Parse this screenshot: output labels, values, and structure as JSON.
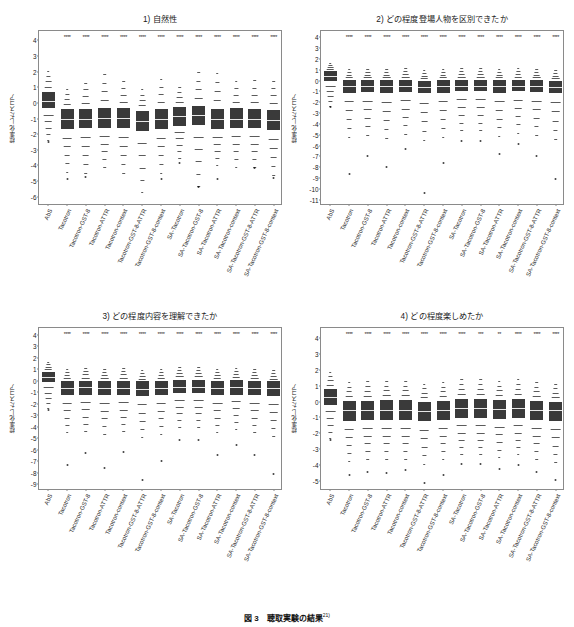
{
  "figure": {
    "caption_number": "図 3",
    "caption_text": "聴取実験の結果",
    "caption_superscript": "21)"
  },
  "axis": {
    "ylabel": "標準化したスコア"
  },
  "categories": [
    "AbS",
    "Tacotron",
    "Tacotron-GST-8",
    "Tacotron-ATTR",
    "Tacotron-context",
    "Tacotron-GST-8-ATTR",
    "Tacotron-GST-8-context",
    "SA-Tacotron",
    "SA-Tacotron-GST-8",
    "SA-Tacotron-ATTR",
    "SA-Tacotron-context",
    "SA-Tacotron-GST-8-ATTR",
    "SA-Tacotron-GST-8-context"
  ],
  "chart_data": [
    {
      "type": "box",
      "panel_id": 1,
      "title": "1) 自然性",
      "xlabel": "",
      "ylabel": "標準化したスコア",
      "ylim": [
        -6.6,
        4.6
      ],
      "yticks": [
        4,
        3,
        2,
        1,
        0,
        -1,
        -2,
        -3,
        -4,
        -5,
        -6
      ],
      "grid": false,
      "categories": [
        "AbS",
        "Tacotron",
        "Tacotron-GST-8",
        "Tacotron-ATTR",
        "Tacotron-context",
        "Tacotron-GST-8-ATTR",
        "Tacotron-GST-8-context",
        "SA-Tacotron",
        "SA-Tacotron-GST-8",
        "SA-Tacotron-ATTR",
        "SA-Tacotron-context",
        "SA-Tacotron-GST-8-ATTR",
        "SA-Tacotron-GST-8-context"
      ],
      "median": [
        0.15,
        -1.05,
        -1.0,
        -0.95,
        -0.95,
        -1.15,
        -1.0,
        -0.85,
        -0.8,
        -1.05,
        -1.0,
        -1.0,
        -1.1
      ],
      "q1": [
        -0.35,
        -1.7,
        -1.6,
        -1.6,
        -1.6,
        -1.8,
        -1.65,
        -1.45,
        -1.4,
        -1.7,
        -1.6,
        -1.6,
        -1.75
      ],
      "q3": [
        0.7,
        -0.4,
        -0.4,
        -0.35,
        -0.35,
        -0.5,
        -0.4,
        -0.25,
        -0.2,
        -0.4,
        -0.35,
        -0.4,
        -0.45
      ],
      "whisker_low": [
        -2.4,
        -4.4,
        -4.5,
        -4.1,
        -4.5,
        -5.7,
        -4.5,
        -3.5,
        -5.3,
        -4.0,
        -4.1,
        -4.1,
        -4.6
      ],
      "whisker_high": [
        2.4,
        1.2,
        1.7,
        2.4,
        1.8,
        1.2,
        2.0,
        1.3,
        2.5,
        2.5,
        1.8,
        1.9,
        1.9
      ],
      "outliers_low": [
        -2.5,
        -4.85,
        -4.75,
        -4.1,
        -4.5,
        -5.7,
        -4.85,
        -3.85,
        -5.4,
        -4.85,
        -4.1,
        -4.15,
        -4.8
      ],
      "significance": [
        "",
        "****",
        "****",
        "****",
        "****",
        "****",
        "****",
        "****",
        "****",
        "****",
        "****",
        "****",
        "****"
      ]
    },
    {
      "type": "box",
      "panel_id": 2,
      "title": "2) どの程度登場人物を区別できたか",
      "xlabel": "",
      "ylabel": "標準化したスコア",
      "ylim": [
        -11.6,
        4.6
      ],
      "yticks": [
        4,
        3,
        2,
        1,
        0,
        -1,
        -2,
        -3,
        -4,
        -5,
        -6,
        -7,
        -8,
        -9,
        -10,
        -11
      ],
      "grid": false,
      "categories": [
        "AbS",
        "Tacotron",
        "Tacotron-GST-8",
        "Tacotron-ATTR",
        "Tacotron-context",
        "Tacotron-GST-8-ATTR",
        "Tacotron-GST-8-context",
        "SA-Tacotron",
        "SA-Tacotron-GST-8",
        "SA-Tacotron-ATTR",
        "SA-Tacotron-context",
        "SA-Tacotron-GST-8-ATTR",
        "SA-Tacotron-GST-8-context"
      ],
      "median": [
        0.45,
        -0.5,
        -0.5,
        -0.5,
        -0.5,
        -0.55,
        -0.5,
        -0.45,
        -0.45,
        -0.5,
        -0.45,
        -0.5,
        -0.55
      ],
      "q1": [
        0.0,
        -1.1,
        -1.05,
        -1.1,
        -1.05,
        -1.15,
        -1.1,
        -1.0,
        -1.0,
        -1.1,
        -1.0,
        -1.05,
        -1.15
      ],
      "q3": [
        0.9,
        0.05,
        0.05,
        0.05,
        0.1,
        0.0,
        0.05,
        0.1,
        0.1,
        0.05,
        0.1,
        0.05,
        0.0
      ],
      "whisker_low": [
        -2.3,
        -5.2,
        -5.0,
        -5.3,
        -4.9,
        -5.5,
        -5.2,
        -4.6,
        -4.6,
        -5.1,
        -4.8,
        -5.0,
        -5.4
      ],
      "whisker_high": [
        1.8,
        1.3,
        1.3,
        1.3,
        1.4,
        1.2,
        1.3,
        1.4,
        1.4,
        1.3,
        1.4,
        1.3,
        1.2
      ],
      "outliers_low": [
        -2.4,
        -8.6,
        -7.0,
        -8.0,
        -6.3,
        -10.4,
        -7.6,
        -5.6,
        -5.6,
        -6.8,
        -5.9,
        -7.0,
        -9.1
      ],
      "significance": [
        "",
        "****",
        "****",
        "****",
        "****",
        "****",
        "****",
        "****",
        "****",
        "****",
        "****",
        "****",
        "****"
      ]
    },
    {
      "type": "box",
      "panel_id": 3,
      "title": "3) どの程度内容を理解できたか",
      "xlabel": "",
      "ylabel": "標準化したスコア",
      "ylim": [
        -9.6,
        4.6
      ],
      "yticks": [
        4,
        3,
        2,
        1,
        0,
        -1,
        -2,
        -3,
        -4,
        -5,
        -6,
        -7,
        -8,
        -9
      ],
      "grid": false,
      "categories": [
        "AbS",
        "Tacotron",
        "Tacotron-GST-8",
        "Tacotron-ATTR",
        "Tacotron-context",
        "Tacotron-GST-8-ATTR",
        "Tacotron-GST-8-context",
        "SA-Tacotron",
        "SA-Tacotron-GST-8",
        "SA-Tacotron-ATTR",
        "SA-Tacotron-context",
        "SA-Tacotron-GST-8-ATTR",
        "SA-Tacotron-GST-8-context"
      ],
      "median": [
        0.35,
        -0.6,
        -0.55,
        -0.6,
        -0.6,
        -0.7,
        -0.6,
        -0.5,
        -0.5,
        -0.6,
        -0.55,
        -0.6,
        -0.65
      ],
      "q1": [
        -0.1,
        -1.25,
        -1.2,
        -1.25,
        -1.25,
        -1.35,
        -1.25,
        -1.1,
        -1.1,
        -1.25,
        -1.2,
        -1.25,
        -1.3
      ],
      "q3": [
        0.8,
        0.0,
        0.0,
        0.0,
        0.0,
        -0.05,
        0.0,
        0.1,
        0.1,
        0.0,
        0.05,
        0.0,
        -0.05
      ],
      "whisker_low": [
        -2.4,
        -4.5,
        -4.4,
        -4.6,
        -4.4,
        -4.9,
        -4.6,
        -4.0,
        -4.0,
        -4.5,
        -4.2,
        -4.5,
        -4.8
      ],
      "whisker_high": [
        1.9,
        1.3,
        1.4,
        1.3,
        1.4,
        1.2,
        1.3,
        1.5,
        1.5,
        1.3,
        1.4,
        1.3,
        1.2
      ],
      "outliers_low": [
        -2.5,
        -7.3,
        -6.3,
        -7.6,
        -6.2,
        -8.6,
        -7.0,
        -5.2,
        -5.2,
        -6.5,
        -5.6,
        -6.5,
        -8.1
      ],
      "significance": [
        "",
        "****",
        "****",
        "****",
        "****",
        "****",
        "****",
        "****",
        "****",
        "****",
        "****",
        "****",
        "****"
      ]
    },
    {
      "type": "box",
      "panel_id": 4,
      "title": "4) どの程度楽しめたか",
      "xlabel": "",
      "ylabel": "標準化したスコア",
      "ylim": [
        -5.6,
        4.6
      ],
      "yticks": [
        4,
        3,
        2,
        1,
        0,
        -1,
        -2,
        -3,
        -4,
        -5
      ],
      "grid": false,
      "categories": [
        "AbS",
        "Tacotron",
        "Tacotron-GST-8",
        "Tacotron-ATTR",
        "Tacotron-context",
        "Tacotron-GST-8-ATTR",
        "Tacotron-GST-8-context",
        "SA-Tacotron",
        "SA-Tacotron-GST-8",
        "SA-Tacotron-ATTR",
        "SA-Tacotron-context",
        "SA-Tacotron-GST-8-ATTR",
        "SA-Tacotron-GST-8-context"
      ],
      "median": [
        0.3,
        -0.55,
        -0.5,
        -0.5,
        -0.5,
        -0.6,
        -0.5,
        -0.4,
        -0.4,
        -0.45,
        -0.4,
        -0.5,
        -0.55
      ],
      "q1": [
        -0.2,
        -1.2,
        -1.15,
        -1.15,
        -1.15,
        -1.25,
        -1.15,
        -1.05,
        -1.05,
        -1.1,
        -1.05,
        -1.15,
        -1.2
      ],
      "q3": [
        0.8,
        0.05,
        0.05,
        0.1,
        0.1,
        0.0,
        0.05,
        0.15,
        0.15,
        0.1,
        0.15,
        0.05,
        0.0
      ],
      "whisker_low": [
        -2.3,
        -3.7,
        -3.6,
        -3.6,
        -3.6,
        -3.9,
        -3.6,
        -3.3,
        -3.3,
        -3.5,
        -3.3,
        -3.6,
        -3.8
      ],
      "whisker_high": [
        2.1,
        1.5,
        1.6,
        1.6,
        1.6,
        1.4,
        1.5,
        1.7,
        1.7,
        1.6,
        1.7,
        1.5,
        1.4
      ],
      "outliers_low": [
        -2.4,
        -4.6,
        -4.4,
        -4.5,
        -4.3,
        -5.1,
        -4.6,
        -3.9,
        -3.9,
        -4.2,
        -4.0,
        -4.4,
        -4.9
      ],
      "significance": [
        "",
        "****",
        "****",
        "****",
        "****",
        "****",
        "****",
        "****",
        "***",
        "**",
        "****",
        "****",
        "****"
      ]
    }
  ]
}
